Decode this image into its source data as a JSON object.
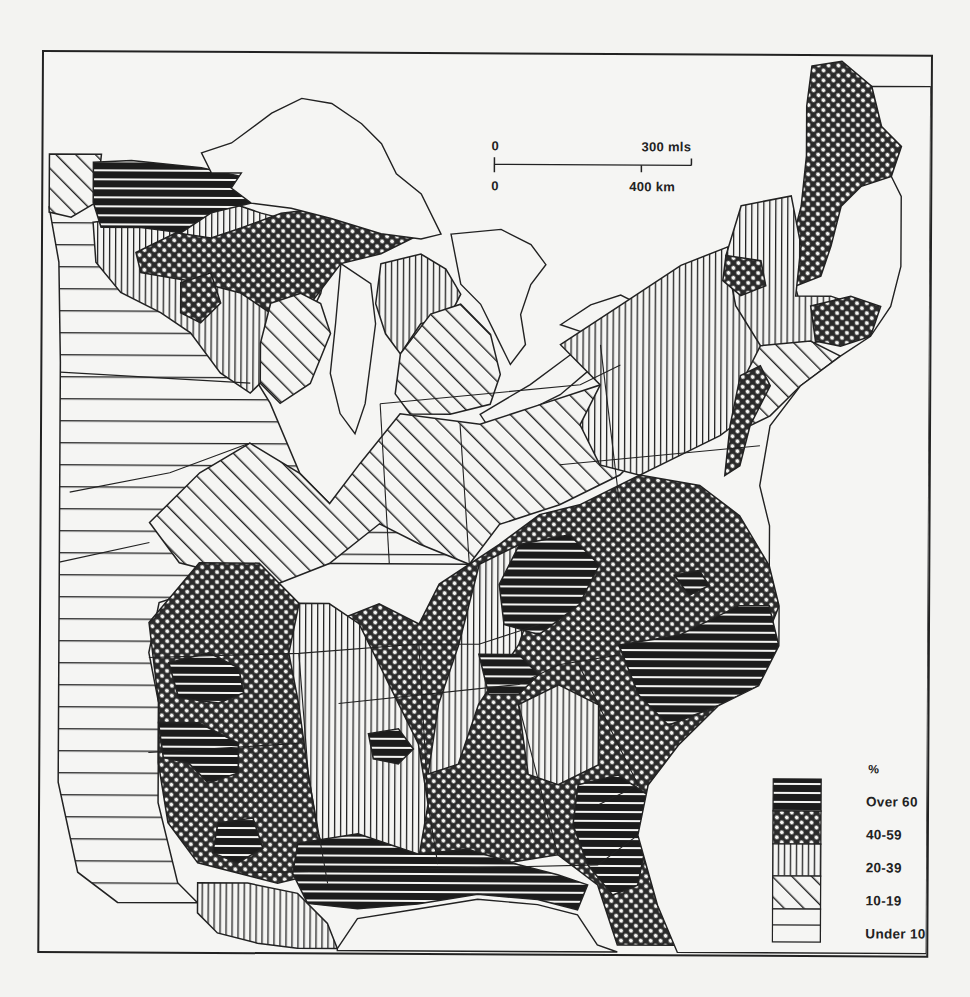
{
  "map": {
    "type": "choropleth",
    "region": "Eastern United States",
    "unit": "%",
    "scale_bar": {
      "miles": {
        "start": "0",
        "end": "300 mls"
      },
      "km": {
        "start": "0",
        "end": "400 km"
      }
    },
    "legend": {
      "title": "%",
      "classes": [
        {
          "label": "Over 60",
          "pattern": "dense-horizontal-black"
        },
        {
          "label": "40-59",
          "pattern": "crosshatch"
        },
        {
          "label": "20-39",
          "pattern": "vertical-lines"
        },
        {
          "label": "10-19",
          "pattern": "diagonal-lines"
        },
        {
          "label": "Under 10",
          "pattern": "sparse-horizontal-lines"
        }
      ]
    },
    "colors": {
      "ink": "#222222",
      "paper": "#f3f3f1"
    }
  }
}
